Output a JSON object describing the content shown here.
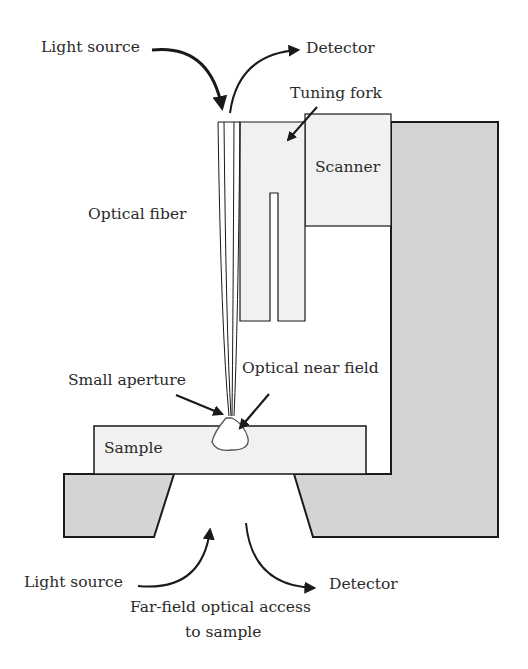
{
  "diagram": {
    "labels": {
      "light_source_top": "Light source",
      "detector_top": "Detector",
      "tuning_fork": "Tuning fork",
      "scanner": "Scanner",
      "optical_fiber": "Optical fiber",
      "small_aperture": "Small aperture",
      "optical_near_field": "Optical near field",
      "sample": "Sample",
      "light_source_bottom": "Light source",
      "detector_bottom": "Detector",
      "far_field_line1": "Far-field optical access",
      "far_field_line2": "to sample"
    },
    "colors": {
      "frame_gray": "#d4d4d4",
      "light_block": "#f1f1f1",
      "stroke": "#1a1a1a"
    }
  }
}
